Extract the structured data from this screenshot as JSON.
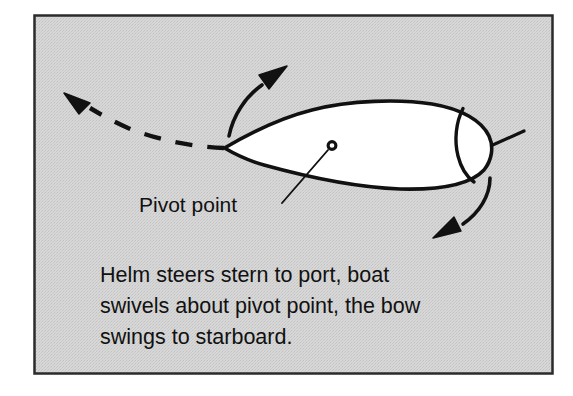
{
  "figure": {
    "name": "boat-pivot-point-diagram",
    "kind": "nautical-steering-diagram",
    "frame": {
      "border_color": "#2b2b2b",
      "fill_color": "#d4d4d4",
      "outer_background": "#ffffff",
      "x": 34,
      "y": 15,
      "width": 519,
      "height": 359
    },
    "ink_color": "#111111",
    "hull_fill": "#ffffff"
  },
  "labels": {
    "pivot_point": "Pivot point"
  },
  "caption": {
    "lines": [
      "Helm steers stern to port, boat",
      "swivels about pivot point, the bow",
      "swings to starboard."
    ],
    "line_1": "Helm steers stern to port, boat",
    "line_2": "swivels about pivot point, the bow",
    "line_3": "swings to starboard."
  },
  "annotations": {
    "bow_swing_arrow": "curved-arrow-up-right",
    "stern_swing_arrow": "curved-arrow-down-left",
    "heading_track": "dashed-curve-with-arrowhead-left",
    "pivot_marker": "small-open-circle",
    "leader_line": "pivot-point-leader",
    "tiller": "tiller-line"
  }
}
